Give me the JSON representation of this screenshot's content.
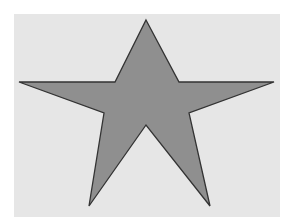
{
  "canvas": {
    "background": "#ffffff",
    "panel_color": "#e6e6e6"
  },
  "shape": {
    "type": "five-pointed-star",
    "fill": "#8f8f8f",
    "stroke": "#333333",
    "points": "146,20 179,82 274,82 189,113 210,206 146,125 89,206 104,113 19,82 115,82"
  }
}
